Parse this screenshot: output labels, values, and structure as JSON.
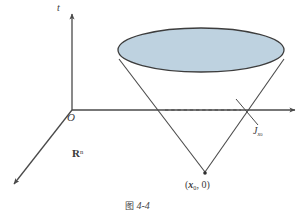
{
  "figure": {
    "caption_cjk": "图",
    "caption_number": "4-4",
    "background_color": "#ffffff",
    "line_color": "#4a4a4a",
    "cone_fill_color": "#bed2e0",
    "cone_stroke_color": "#3d3d3d",
    "text_color": "#3a3a3a"
  },
  "axes": {
    "vertical_label": "t",
    "origin_label": "O",
    "space_label_base": "R",
    "space_label_exponent": "n",
    "origin_point": {
      "x": 72,
      "y": 110
    },
    "vertical_axis_top": {
      "x": 72,
      "y": 12
    },
    "horizontal_axis_end": {
      "x": 297,
      "y": 110
    },
    "diagonal_axis_end": {
      "x": 12,
      "y": 186
    }
  },
  "cone": {
    "apex_point_label_open": "(",
    "apex_point_vector": "x",
    "apex_point_subscript": "0",
    "apex_point_rest": ", 0)",
    "apex_coords": {
      "x": 205,
      "y": 173
    },
    "ellipse_center": {
      "x": 201,
      "y": 50
    },
    "ellipse_rx": 83,
    "ellipse_ry": 22
  },
  "annotations": {
    "cone_surface_label_base": "J",
    "cone_surface_label_sub_var": "x",
    "cone_surface_label_sub_num": "0",
    "dashed_line_start": {
      "x": 165,
      "y": 110
    },
    "dashed_line_end": {
      "x": 241,
      "y": 110
    }
  }
}
